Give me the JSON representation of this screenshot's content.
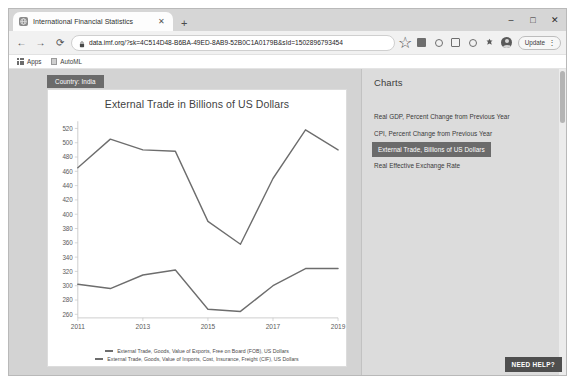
{
  "window": {
    "minimize_label": "–",
    "maximize_label": "□",
    "close_label": "✕"
  },
  "tab": {
    "title": "International Financial Statistics",
    "close_label": "✕",
    "new_tab_label": "+",
    "favicon_name": "globe-icon"
  },
  "toolbar": {
    "back_label": "←",
    "forward_label": "→",
    "reload_label": "⟳",
    "url": "data.imf.org/?sk=4C514D48-B6BA-49ED-8AB9-52B0C1A0179B&sId=1502896793454",
    "lock_label": "lock-icon",
    "bookmark_star_label": "☆",
    "update_label": "Update",
    "menu_label": "⋮"
  },
  "bookmarks": [
    {
      "label": "Apps",
      "icon": "apps-grid-icon"
    },
    {
      "label": "AutoML",
      "icon": "document-icon"
    }
  ],
  "page": {
    "country_tab": "Country: India",
    "sidebar": {
      "heading": "Charts",
      "items": [
        {
          "label": "Real GDP, Percent Change from Previous Year",
          "selected": false
        },
        {
          "label": "CPI, Percent Change from Previous Year",
          "selected": false
        },
        {
          "label": "External Trade, Billions of US Dollars",
          "selected": true
        },
        {
          "label": "Real Effective Exchange Rate",
          "selected": false
        }
      ]
    },
    "need_help_label": "NEED HELP?"
  },
  "chart_data": {
    "type": "line",
    "title": "External Trade in Billions of US Dollars",
    "xlabel": "",
    "ylabel": "",
    "x": [
      2011,
      2012,
      2013,
      2014,
      2015,
      2016,
      2017,
      2018,
      2019
    ],
    "xticks": [
      2011,
      2013,
      2015,
      2017,
      2019
    ],
    "yticks": [
      260,
      280,
      300,
      320,
      340,
      360,
      380,
      400,
      420,
      440,
      460,
      480,
      500,
      520
    ],
    "ylim": [
      255,
      530
    ],
    "grid": false,
    "legend_position": "bottom",
    "series": [
      {
        "name": "External Trade, Goods, Value of Imports, Cost, Insurance, Freight (CIF), US Dollars",
        "color": "#6d6d6d",
        "values": [
          465,
          505,
          490,
          488,
          390,
          358,
          450,
          518,
          490
        ]
      },
      {
        "name": "External Trade, Goods, Value of Exports, Free on Board (FOB), US Dollars",
        "color": "#6d6d6d",
        "values": [
          302,
          296,
          315,
          322,
          267,
          264,
          300,
          324,
          324
        ]
      }
    ]
  },
  "colors": {
    "line": "#6d6d6d",
    "selected_bg": "#6b6b6b",
    "page_bg": "#d3d3d3",
    "sidebar_bg": "#dcdcdc"
  }
}
